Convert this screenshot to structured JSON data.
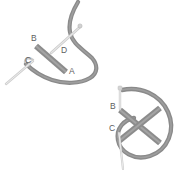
{
  "image": {
    "title": "Suture knot tying sequence",
    "background_color": "#ffffff",
    "width": 188,
    "height": 171
  },
  "palette": {
    "thread_gray": "#8a8a8a",
    "thread_dark": "#6e6e6e",
    "instrument_gray": "#8c8c8c",
    "needle_light": "#d8d8d8",
    "needle_edge": "#bcbcbc",
    "label_color": "#5e5e5e"
  },
  "panels": [
    {
      "id": "panel-top-left",
      "name": "upper-left-suture-figure",
      "labels": [
        {
          "id": "label-a",
          "text": "A",
          "x": 69,
          "y": 74
        },
        {
          "id": "label-b",
          "text": "B",
          "x": 31,
          "y": 41
        },
        {
          "id": "label-c",
          "text": "C",
          "x": 25,
          "y": 63
        },
        {
          "id": "label-d",
          "text": "D",
          "x": 61,
          "y": 53
        }
      ],
      "elements": [
        {
          "id": "thread-arc",
          "name": "curved-thread",
          "color": "#8a8a8a"
        },
        {
          "id": "instrument-bar",
          "name": "needle-holder-bar",
          "color": "#8c8c8c"
        },
        {
          "id": "needle-c",
          "name": "needle-shaft-c",
          "color": "#d8d8d8"
        },
        {
          "id": "needle-d",
          "name": "needle-shaft-d",
          "color": "#d8d8d8"
        }
      ]
    },
    {
      "id": "panel-bottom-right",
      "name": "lower-right-suture-figure",
      "labels": [
        {
          "id": "label-b2",
          "text": "B",
          "x": 112,
          "y": 109
        },
        {
          "id": "label-c2",
          "text": "C",
          "x": 111,
          "y": 131
        }
      ],
      "elements": [
        {
          "id": "thread-loop",
          "name": "thread-loop",
          "color": "#8a8a8a"
        },
        {
          "id": "cross-bar-1",
          "name": "instrument-bar-descending",
          "color": "#8c8c8c"
        },
        {
          "id": "cross-bar-2",
          "name": "instrument-bar-ascending",
          "color": "#8c8c8c"
        },
        {
          "id": "needle-vertical",
          "name": "needle-shaft-vertical",
          "color": "#d8d8d8"
        }
      ]
    }
  ]
}
